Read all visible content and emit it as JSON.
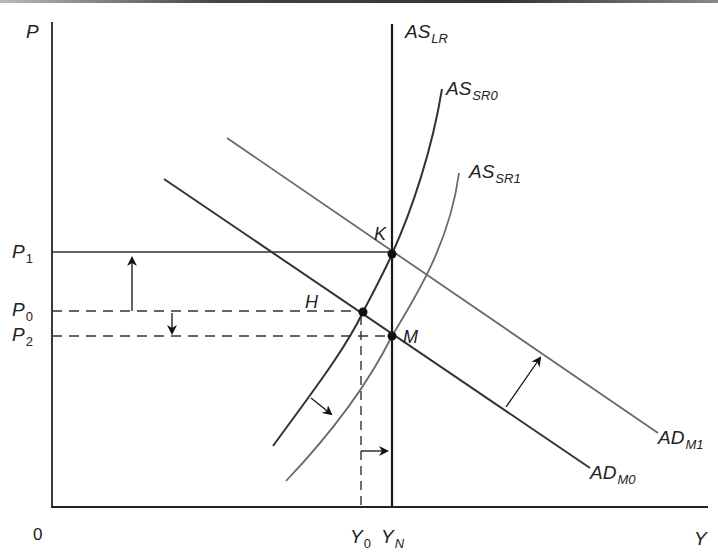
{
  "diagram": {
    "title": "",
    "axes": {
      "y_label": "P",
      "x_label": "Y",
      "origin_label": "0"
    },
    "price_levels": [
      {
        "id": "P1",
        "base": "P",
        "sub": "1",
        "style": "solid"
      },
      {
        "id": "P0",
        "base": "P",
        "sub": "0",
        "style": "dashed"
      },
      {
        "id": "P2",
        "base": "P",
        "sub": "2",
        "style": "dashed"
      }
    ],
    "output_levels": [
      {
        "id": "Y0",
        "base": "Y",
        "sub": "0",
        "style": "dashed"
      },
      {
        "id": "YN",
        "base": "Y",
        "sub": "N",
        "style": "solid"
      }
    ],
    "curves": {
      "as_lr": {
        "base": "AS",
        "sub": "LR",
        "color": "#1a1a1a"
      },
      "as_sr0": {
        "base": "AS",
        "sub": "SR0",
        "color": "#333333"
      },
      "as_sr1": {
        "base": "AS",
        "sub": "SR1",
        "color": "#6a6a6a"
      },
      "ad_m0": {
        "base": "AD",
        "sub": "M0",
        "color": "#333333"
      },
      "ad_m1": {
        "base": "AD",
        "sub": "M1",
        "color": "#6a6a6a"
      }
    },
    "points": [
      {
        "id": "K",
        "label": "K",
        "desc": "AD_M1 ∩ AS_LR ∩ AS_SR0 at P1"
      },
      {
        "id": "H",
        "label": "H",
        "desc": "AD_M0 ∩ AS_SR0 at P0, Y0"
      },
      {
        "id": "M",
        "label": "M",
        "desc": "AD_M0 ∩ AS_LR ∩ AS_SR1 at P2, YN"
      }
    ],
    "arrows": [
      {
        "id": "price-up",
        "desc": "price rises P0 → P1"
      },
      {
        "id": "price-down",
        "desc": "price falls P0 → P2"
      },
      {
        "id": "as-shift",
        "desc": "AS_SR0 shifts right to AS_SR1"
      },
      {
        "id": "output-shift",
        "desc": "output rises Y0 → YN"
      },
      {
        "id": "ad-shift",
        "desc": "AD_M0 shifts right to AD_M1"
      }
    ]
  }
}
